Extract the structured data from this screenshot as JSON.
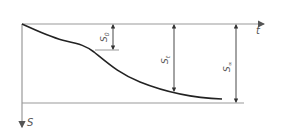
{
  "diagram": {
    "axes": {
      "x_label": "t",
      "y_label": "S"
    },
    "dimensions": [
      {
        "label": "S",
        "subscript": "0"
      },
      {
        "label": "S",
        "subscript": "t"
      },
      {
        "label": "S",
        "subscript": "∞"
      }
    ],
    "colors": {
      "line": "#888888",
      "curve": "#222222",
      "text": "#555555"
    }
  }
}
